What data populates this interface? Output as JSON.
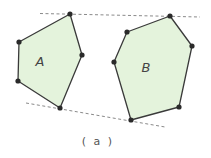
{
  "figure": {
    "caption": "( a )",
    "polygons": [
      {
        "label": "A",
        "fill": "#e4f3dc",
        "vertices": [
          [
            70,
            14
          ],
          [
            82,
            55
          ],
          [
            60,
            108
          ],
          [
            18,
            81
          ],
          [
            19,
            42
          ]
        ],
        "label_pos": [
          40,
          66
        ]
      },
      {
        "label": "B",
        "fill": "#e4f3dc",
        "vertices": [
          [
            170,
            16
          ],
          [
            192,
            46
          ],
          [
            179,
            107
          ],
          [
            131,
            120
          ],
          [
            114,
            62
          ],
          [
            127,
            32
          ]
        ],
        "label_pos": [
          146,
          72
        ]
      }
    ],
    "tangent_lines": [
      {
        "name": "top-tangent",
        "from": [
          40,
          13.5
        ],
        "to": [
          200,
          17
        ]
      },
      {
        "name": "bottom-tangent",
        "from": [
          26,
          103
        ],
        "to": [
          165,
          127
        ]
      }
    ]
  }
}
